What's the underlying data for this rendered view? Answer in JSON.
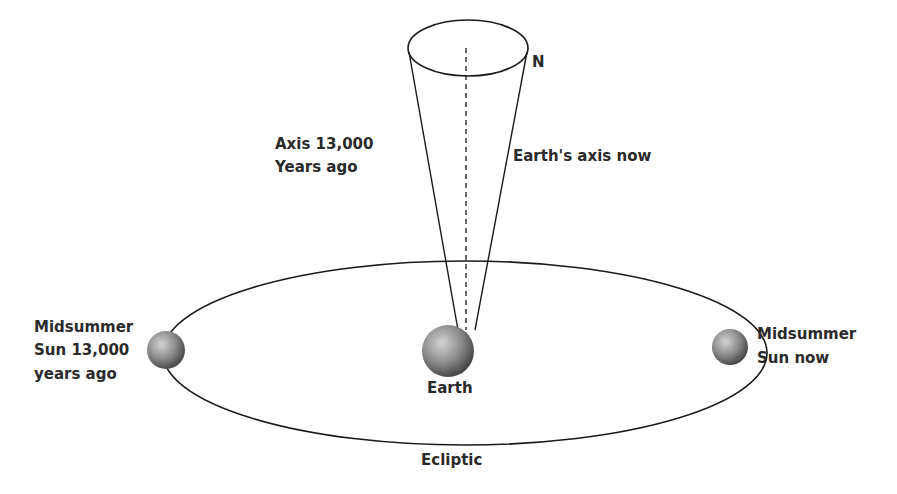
{
  "diagram": {
    "labels": {
      "north": "N",
      "axis_past_line1": "Axis 13,000",
      "axis_past_line2": "Years ago",
      "axis_now": "Earth's axis now",
      "sun_past_line1": "Midsummer",
      "sun_past_line2": "Sun 13,000",
      "sun_past_line3": "years ago",
      "earth": "Earth",
      "sun_now_line1": "Midsummer",
      "sun_now_line2": "Sun now",
      "ecliptic": "Ecliptic"
    },
    "colors": {
      "line": "#1a1a1a",
      "sphere_light": "#c8c8c8",
      "sphere_dark": "#4a4a4a",
      "background": "#ffffff"
    }
  }
}
